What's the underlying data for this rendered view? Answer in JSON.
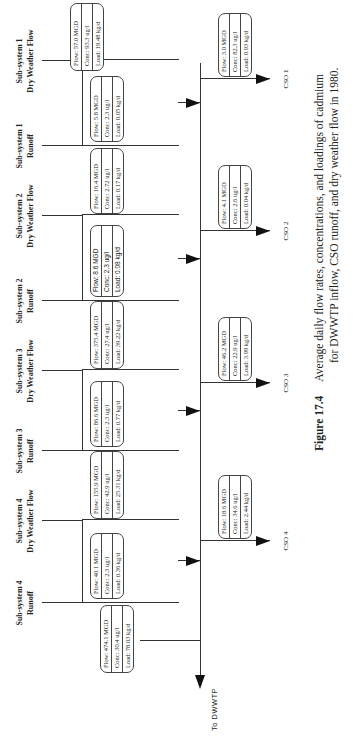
{
  "subsystems": [
    {
      "id": "ss4-runoff",
      "line1": "Sub-system 4",
      "line2": "Runoff",
      "box": {
        "flow": "Flow: 40.1  MGD",
        "conc": "Conc:  2.3    ug/l",
        "load": "Load:  0.36   kg/d"
      }
    },
    {
      "id": "ss4-dwf",
      "line1": "Sub-system 4",
      "line2": "Dry Weather Flow",
      "box": {
        "flow": "Flow: 155.9 MGD",
        "conc": "Conc:  42.9   ug/l",
        "load": "Load:  25.31 kg/d"
      }
    },
    {
      "id": "ss3-runoff",
      "line1": "Sub-system 3",
      "line2": "Runoff",
      "box": {
        "flow": "Flow: 86.6  MGD",
        "conc": "Conc:  2.3    ug/l",
        "load": "Load:  0.77   kg/d"
      }
    },
    {
      "id": "ss3-dwf",
      "line1": "Sub-system 3",
      "line2": "Dry Weather Flow",
      "box": {
        "flow": "Flow: 375.4 MGD",
        "conc": "Conc:  27.4   ug/l",
        "load": "Load:  39.22 kg/d"
      }
    },
    {
      "id": "ss2-runoff",
      "line1": "Sub-system 2",
      "line2": "Runoff",
      "box": {
        "flow": "Flow:   8.6   MGD",
        "conc": "Conc:   2.3    ug/l",
        "load": "Load:  0.08  kg/d"
      }
    },
    {
      "id": "ss2-dwf",
      "line1": "Sub-system 2",
      "line2": "Dry Weather  Flow",
      "box": {
        "flow": "Flow: 16.4 MGD",
        "conc": "Conc:  2.72  ug/l",
        "load": "Load:  0.17  kg/d"
      }
    },
    {
      "id": "ss1-runoff",
      "line1": "Sub-system 1",
      "line2": "Runoff",
      "box": {
        "flow": "Flow:  5.8   MGD",
        "conc": "Conc:  2.3    ug/l",
        "load": "Load:  0.05  kg/d"
      }
    },
    {
      "id": "ss1-dwf",
      "line1": "Sub-system 1",
      "line2": "Dry Weather  Flow",
      "box": {
        "flow": "Flow:  57.0  MGD",
        "conc": "Conc:  93.3   ug/l",
        "load": "Load:  19.48 kg/d"
      }
    }
  ],
  "cso": [
    {
      "label": "CSO 4",
      "box": {
        "flow": "Flow:  18.6  MGD",
        "conc": "Conc:  34.6   ug/l",
        "load": "Load:  2.44   kg/d"
      }
    },
    {
      "label": "CSO 3",
      "box": {
        "flow": "Flow:  46.2  MGD",
        "conc": "Conc:  22.9   ug/l",
        "load": "Load:  3.99   kg/d"
      }
    },
    {
      "label": "CSO 2",
      "box": {
        "flow": "Flow:   4.1   MGD",
        "conc": "Conc:  2.6    ug/l",
        "load": "Load:  0.04  kg/d"
      }
    },
    {
      "label": "CSO 1",
      "box": {
        "flow": "Flow:   3.0   MGD",
        "conc": "Conc:  82.3  ug/l",
        "load": "Load:  0.93  kg/d"
      }
    }
  ],
  "dwwtp": {
    "label": "To DWWTP",
    "box": {
      "flow": "Flow: 474.1 MGD",
      "conc": "Conc:  30.4   ug/l",
      "load": "Load: 78.03  kg/d"
    }
  },
  "caption": {
    "figure": "Figure 17.4",
    "line1": "Average daily flow rates, concentrations, and loadings of cadmium",
    "line2": "for DWWTP inflow, CSO runoff, and dry weather flow in 1980."
  }
}
